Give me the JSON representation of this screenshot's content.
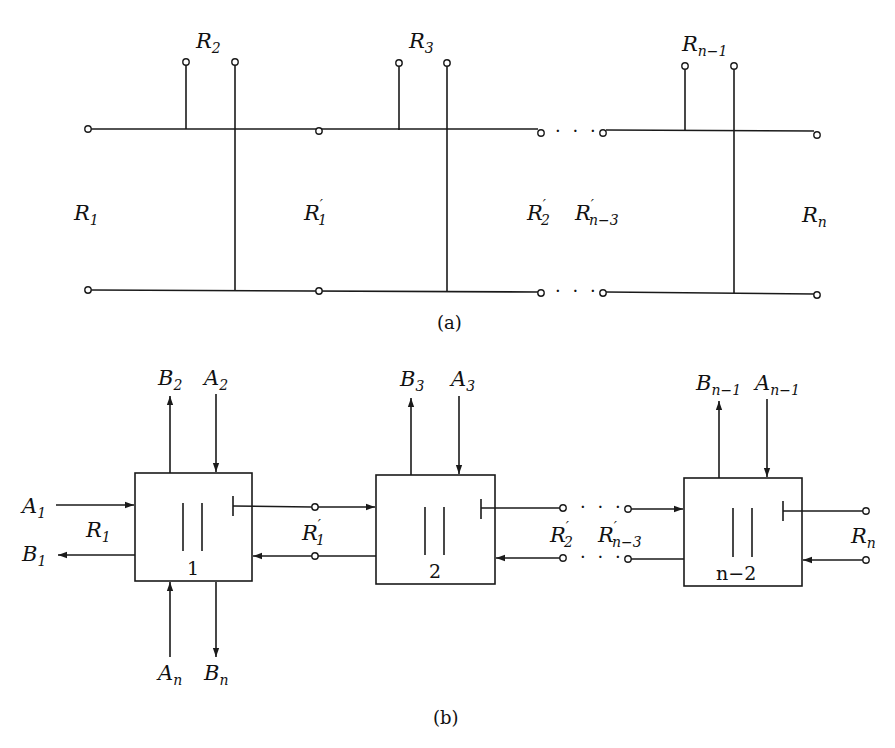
{
  "figure_a": {
    "caption": "(a)",
    "labels": {
      "r1": {
        "base": "R",
        "sub": "1",
        "prime": ""
      },
      "r2": {
        "base": "R",
        "sub": "2",
        "prime": ""
      },
      "r3": {
        "base": "R",
        "sub": "3",
        "prime": ""
      },
      "rn_1": {
        "base": "R",
        "sub": "n−1",
        "prime": ""
      },
      "rn": {
        "base": "R",
        "sub": "n",
        "prime": ""
      },
      "r1p": {
        "base": "R",
        "sub": "1",
        "prime": "′"
      },
      "r2p": {
        "base": "R",
        "sub": "2",
        "prime": "′"
      },
      "rn_3p": {
        "base": "R",
        "sub": "n−3",
        "prime": "′"
      }
    },
    "ellipsis": "· · ·"
  },
  "figure_b": {
    "caption": "(b)",
    "blocks": [
      {
        "number": "1"
      },
      {
        "number": "2"
      },
      {
        "number": "n−2"
      }
    ],
    "labels": {
      "a1": {
        "base": "A",
        "sub": "1"
      },
      "b1": {
        "base": "B",
        "sub": "1"
      },
      "r1": {
        "base": "R",
        "sub": "1"
      },
      "b2": {
        "base": "B",
        "sub": "2"
      },
      "a2": {
        "base": "A",
        "sub": "2"
      },
      "an": {
        "base": "A",
        "sub": "n"
      },
      "bn": {
        "base": "B",
        "sub": "n"
      },
      "r1p": {
        "base": "R",
        "sub": "1",
        "prime": "′"
      },
      "b3": {
        "base": "B",
        "sub": "3"
      },
      "a3": {
        "base": "A",
        "sub": "3"
      },
      "r2p": {
        "base": "R",
        "sub": "2",
        "prime": "′"
      },
      "rn_3p": {
        "base": "R",
        "sub": "n−3",
        "prime": "′"
      },
      "bn_1": {
        "base": "B",
        "sub": "n−1"
      },
      "an_1": {
        "base": "A",
        "sub": "n−1"
      },
      "rn": {
        "base": "R",
        "sub": "n"
      }
    },
    "ellipsis": "· · ·"
  }
}
